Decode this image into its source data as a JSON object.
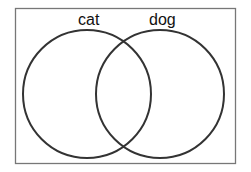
{
  "diagram": {
    "type": "venn",
    "sets": [
      {
        "label": "cat"
      },
      {
        "label": "dog"
      }
    ]
  }
}
